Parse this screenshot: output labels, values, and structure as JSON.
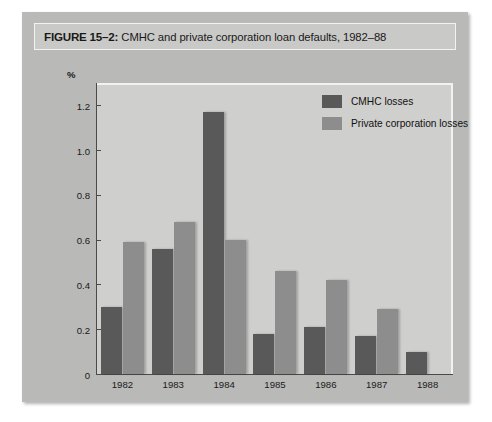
{
  "figure": {
    "label": "FIGURE 15–2:",
    "title": " CMHC and private corporation loan defaults, 1982–88"
  },
  "colors": {
    "cmhc": "#59595a",
    "private": "#8d8d8d",
    "panel": "#b9b9b7",
    "plot_background": "#cfcfcd",
    "axis": "#4a4a4a"
  },
  "chart_data": {
    "type": "bar",
    "title": "CMHC and private corporation loan defaults, 1982–88",
    "xlabel": "",
    "ylabel": "%",
    "ylim": [
      0,
      1.3
    ],
    "yticks": [
      0,
      0.2,
      0.4,
      0.6,
      0.8,
      1.0,
      1.2
    ],
    "ytick_labels": [
      "0",
      "0.2",
      "0.4",
      "0.6",
      "0.8",
      "1.0",
      "1.2"
    ],
    "grid": false,
    "legend_position": "upper-right-inside",
    "categories": [
      "1982",
      "1983",
      "1984",
      "1985",
      "1986",
      "1987",
      "1988"
    ],
    "series": [
      {
        "name": "CMHC losses",
        "color": "#59595a",
        "values": [
          0.3,
          0.56,
          1.17,
          0.18,
          0.21,
          0.17,
          0.1
        ]
      },
      {
        "name": "Private corporation losses",
        "color": "#8d8d8d",
        "values": [
          0.59,
          0.68,
          0.6,
          0.46,
          0.42,
          0.29,
          null
        ]
      }
    ]
  }
}
